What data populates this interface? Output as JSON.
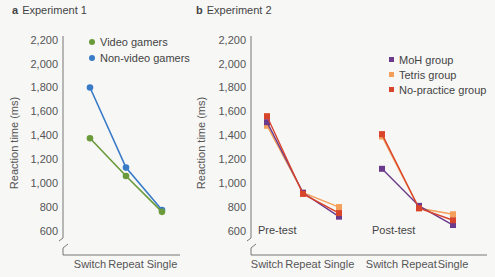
{
  "panels": [
    {
      "letter": "a",
      "title": "Experiment 1"
    },
    {
      "letter": "b",
      "title": "Experiment 2"
    }
  ],
  "chart_data": [
    {
      "type": "line",
      "title": "a Experiment 1",
      "xlabel": "",
      "ylabel": "Reaction time (ms)",
      "ylim": [
        600,
        2200
      ],
      "yticks": [
        "2,200",
        "2,000",
        "1,800",
        "1,600",
        "1,400",
        "1,200",
        "1,000",
        "800",
        "600"
      ],
      "categories": [
        "Switch",
        "Repeat",
        "Single"
      ],
      "legend_position": "upper right (inside)",
      "series": [
        {
          "name": "Video gamers",
          "color": "#6a9a3a",
          "marker": "circle",
          "values": [
            1375,
            1060,
            760
          ]
        },
        {
          "name": "Non-video gamers",
          "color": "#3a7bc8",
          "marker": "circle",
          "values": [
            1800,
            1130,
            775
          ]
        }
      ]
    },
    {
      "type": "line",
      "title": "b Experiment 2",
      "xlabel": "",
      "ylabel": "Reaction time (ms)",
      "ylim": [
        600,
        2200
      ],
      "yticks": [
        "2,200",
        "2,000",
        "1,800",
        "1,600",
        "1,400",
        "1,200",
        "1,000",
        "800",
        "600"
      ],
      "groups": [
        "Pre-test",
        "Post-test"
      ],
      "categories": [
        "Switch",
        "Repeat",
        "Single"
      ],
      "legend_position": "upper right (inside)",
      "series": [
        {
          "name": "MoH group",
          "color": "#6b3a8c",
          "marker": "square",
          "pre": [
            1510,
            920,
            720
          ],
          "post": [
            1120,
            810,
            650
          ]
        },
        {
          "name": "Tetris group",
          "color": "#f4a05a",
          "marker": "square",
          "pre": [
            1480,
            920,
            800
          ],
          "post": [
            1390,
            790,
            740
          ]
        },
        {
          "name": "No-practice group",
          "color": "#d9452b",
          "marker": "square",
          "pre": [
            1560,
            910,
            750
          ],
          "post": [
            1410,
            790,
            690
          ]
        }
      ]
    }
  ],
  "labels": {
    "ylabel": "Reaction time (ms)",
    "pre_test": "Pre-test",
    "post_test": "Post-test"
  }
}
